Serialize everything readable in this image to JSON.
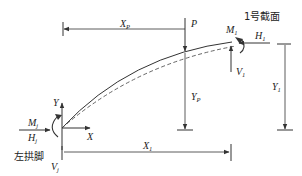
{
  "diagram": {
    "type": "arch-force-diagram",
    "section_label": "1号截面",
    "left_support_label": "左拱脚",
    "colors": {
      "line": "#333333",
      "background": "#ffffff"
    },
    "labels": {
      "xp": "X",
      "xp_sub": "P",
      "p": "P",
      "m1": "M",
      "m1_sub": "1",
      "h1": "H",
      "h1_sub": "1",
      "v1": "V",
      "v1_sub": "1",
      "yp": "Y",
      "yp_sub": "P",
      "y1": "Y",
      "y1_sub": "1",
      "x1": "X",
      "x1_sub": "1",
      "mj": "M",
      "mj_sub": "j",
      "hj": "H",
      "hj_sub": "j",
      "vj": "V",
      "vj_sub": "j",
      "axis_y": "Y",
      "axis_x": "X"
    },
    "curves": {
      "arch_axis": "solid",
      "deflected_axis": "dashed"
    }
  }
}
